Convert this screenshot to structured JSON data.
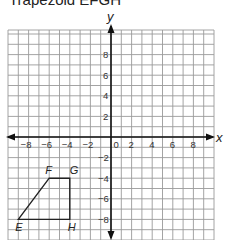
{
  "title": "Trapezoid EFGH",
  "plane": {
    "x_label": "x",
    "y_label": "y",
    "x_range": [
      -10,
      10
    ],
    "y_range": [
      -10,
      10
    ],
    "x_ticks": [
      "-8",
      "-6",
      "-4",
      "-2",
      "0",
      "2",
      "4",
      "6",
      "8"
    ],
    "y_ticks": [
      "8",
      "6",
      "4",
      "2",
      "-2",
      "-4",
      "-6",
      "-8"
    ],
    "grid": true
  },
  "shape": {
    "name": "Trapezoid EFGH",
    "vertices": [
      {
        "label": "E",
        "x": -9,
        "y": -8
      },
      {
        "label": "F",
        "x": -6,
        "y": -4
      },
      {
        "label": "G",
        "x": -4,
        "y": -4
      },
      {
        "label": "H",
        "x": -4,
        "y": -8
      }
    ]
  }
}
